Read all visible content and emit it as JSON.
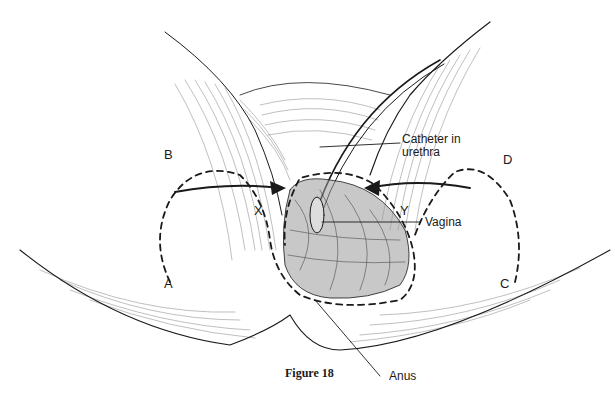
{
  "figure": {
    "caption": "Figure 18",
    "labels": {
      "catheter_line1": "Catheter in",
      "catheter_line2": "urethra",
      "vagina": "Vagina",
      "anus": "Anus"
    },
    "flap_letters": {
      "a": "A",
      "b": "B",
      "c": "C",
      "d": "D",
      "x": "X",
      "y": "Y"
    },
    "colors": {
      "ink": "#1a1a1a",
      "background": "#ffffff"
    }
  }
}
